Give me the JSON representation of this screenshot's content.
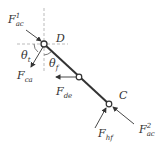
{
  "diagram": {
    "title": "",
    "nodes": [
      {
        "id": "D",
        "label": "D"
      },
      {
        "id": "mid",
        "label": ""
      },
      {
        "id": "C",
        "label": "C"
      }
    ],
    "forces": {
      "f_ac1": {
        "main": "F",
        "sub": "ac",
        "sup": "1"
      },
      "f_ca": {
        "main": "F",
        "sub": "ca"
      },
      "f_de": {
        "main": "F",
        "sub": "de"
      },
      "f_hf": {
        "main": "F",
        "sub": "hf"
      },
      "f_ac2": {
        "main": "F",
        "sub": "ac",
        "sup": "2"
      }
    },
    "angles": {
      "theta_t": {
        "main": "θ",
        "sub": "t"
      },
      "theta_f": {
        "main": "θ",
        "sub": "f"
      }
    },
    "colors": {
      "line": "#333333",
      "dash": "#aaaaaa",
      "node_fill": "#ffffff"
    }
  }
}
